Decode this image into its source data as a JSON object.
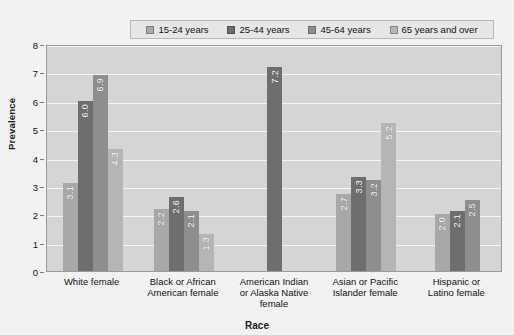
{
  "chart_data": {
    "type": "bar",
    "title": "",
    "xlabel": "Race",
    "ylabel": "Prevalence",
    "ylim": [
      0,
      8
    ],
    "yticks": [
      0,
      1,
      2,
      3,
      4,
      5,
      6,
      7,
      8
    ],
    "grid": true,
    "legend_position": "top",
    "categories": [
      "White female",
      "Black or African American female",
      "American Indian or Alaska Native female",
      "Asian or Pacific Islander female",
      "Hispanic or Latino female"
    ],
    "category_lines": [
      [
        "White female"
      ],
      [
        "Black or African",
        "American female"
      ],
      [
        "American Indian",
        "or Alaska Native",
        "female"
      ],
      [
        "Asian or Pacific",
        "Islander female"
      ],
      [
        "Hispanic or",
        "Latino female"
      ]
    ],
    "series": [
      {
        "name": "15-24 years",
        "color": "#a8a8a8",
        "values": [
          3.1,
          2.2,
          null,
          2.7,
          2.0
        ],
        "labels": [
          "3.1",
          "2.2",
          "",
          "2.7",
          "2.0"
        ]
      },
      {
        "name": "25-44 years",
        "color": "#6e6e6e",
        "values": [
          6.0,
          2.6,
          7.2,
          3.3,
          2.1
        ],
        "labels": [
          "6.0",
          "2.6",
          "7.2",
          "3.3",
          "2.1"
        ]
      },
      {
        "name": "45-64 years",
        "color": "#8e8e8e",
        "values": [
          6.9,
          2.1,
          null,
          3.2,
          2.5
        ],
        "labels": [
          "6.9",
          "2.1",
          "",
          "3.2",
          "2.5"
        ]
      },
      {
        "name": "65 years and over",
        "color": "#b5b5b5",
        "values": [
          4.3,
          1.3,
          null,
          5.2,
          null
        ],
        "labels": [
          "4.3",
          "1.3",
          "",
          "5.2",
          ""
        ]
      }
    ]
  },
  "legend": {
    "items": [
      {
        "label": "15-24 years"
      },
      {
        "label": "25-44 years"
      },
      {
        "label": "45-64 years"
      },
      {
        "label": "65 years and over"
      }
    ]
  },
  "axes": {
    "y_title": "Prevalence",
    "x_title": "Race"
  },
  "colors": {
    "plot_background": "#d5d5d5",
    "page_background": "#f2f2f2",
    "gridline": "#f4f4f4",
    "legend_background": "#e6e6e6",
    "axis_border": "#9a9a9a"
  }
}
